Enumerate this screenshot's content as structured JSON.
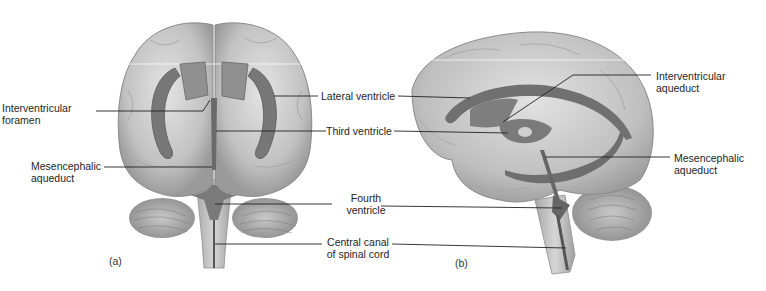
{
  "figure": {
    "panels": [
      {
        "id": "a",
        "letter": "(a)",
        "view": "anterior"
      },
      {
        "id": "b",
        "letter": "(b)",
        "view": "lateral"
      }
    ],
    "labels": {
      "interventricular_foramen": {
        "line1": "Interventricular",
        "line2": "foramen"
      },
      "mesencephalic_aqueduct_a": {
        "line1": "Mesencephalic",
        "line2": "aqueduct"
      },
      "lateral_ventricle": {
        "line1": "Lateral ventricle"
      },
      "third_ventricle": {
        "line1": "Third ventricle"
      },
      "fourth_ventricle": {
        "line1": "Fourth",
        "line2": "ventricle"
      },
      "central_canal": {
        "line1": "Central canal",
        "line2": "of spinal cord"
      },
      "interventricular_aqueduct": {
        "line1": "Interventricular",
        "line2": "aqueduct"
      },
      "mesencephalic_aqueduct_b": {
        "line1": "Mesencephalic",
        "line2": "aqueduct"
      }
    },
    "colors": {
      "brain_light": "#d9d9d9",
      "brain_mid": "#b8b8b8",
      "brain_dark": "#8e8e8e",
      "ventricle": "#6e6e6e",
      "leader_line": "#222222"
    }
  }
}
